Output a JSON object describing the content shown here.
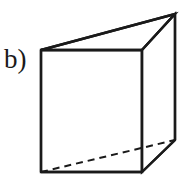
{
  "figure": {
    "part_label": "b)",
    "shape_name": "triangular-prism",
    "background_color": "#ffffff",
    "stroke_color": "#1a1a1a",
    "stroke_width": 2.4,
    "hidden_stroke_width": 2.0,
    "hidden_dash_pattern": "7 5",
    "canvas": {
      "width": 188,
      "height": 181
    },
    "vertices": {
      "front_top_left": {
        "x": 41,
        "y": 50
      },
      "front_top_right": {
        "x": 142,
        "y": 50
      },
      "front_bottom_right": {
        "x": 142,
        "y": 172
      },
      "front_bottom_left": {
        "x": 41,
        "y": 172
      },
      "back_top": {
        "x": 175,
        "y": 14
      },
      "back_bottom": {
        "x": 175,
        "y": 140
      }
    },
    "edges": [
      {
        "name": "front-face-top-edge",
        "from": "front_top_left",
        "to": "front_top_right",
        "style": "solid"
      },
      {
        "name": "front-face-right-edge",
        "from": "front_top_right",
        "to": "front_bottom_right",
        "style": "solid"
      },
      {
        "name": "front-face-bottom-edge",
        "from": "front_bottom_right",
        "to": "front_bottom_left",
        "style": "solid"
      },
      {
        "name": "front-face-left-edge",
        "from": "front_bottom_left",
        "to": "front_top_left",
        "style": "solid"
      },
      {
        "name": "top-back-slant-edge",
        "from": "front_top_left",
        "to": "back_top",
        "style": "solid"
      },
      {
        "name": "top-right-slant-edge",
        "from": "front_top_right",
        "to": "back_top",
        "style": "solid"
      },
      {
        "name": "back-vertical-edge",
        "from": "back_top",
        "to": "back_bottom",
        "style": "solid"
      },
      {
        "name": "bottom-right-slant-edge",
        "from": "front_bottom_right",
        "to": "back_bottom",
        "style": "solid"
      },
      {
        "name": "hidden-base-diagonal-edge",
        "from": "front_bottom_left",
        "to": "back_bottom",
        "style": "dashed"
      }
    ]
  }
}
